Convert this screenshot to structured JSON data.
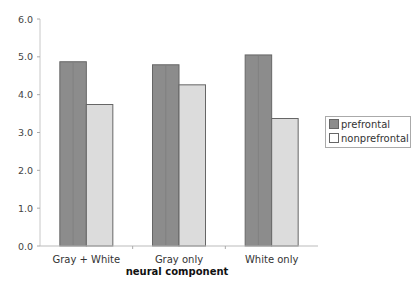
{
  "chart_data": {
    "type": "bar",
    "title": "",
    "xlabel": "neural component",
    "ylabel": "",
    "categories": [
      "Gray + White",
      "Gray only",
      "White only"
    ],
    "series": [
      {
        "name": "prefrontal",
        "values": [
          4.87,
          4.79,
          5.05
        ],
        "color": "#8c8c8c"
      },
      {
        "name": "nonprefrontal",
        "values": [
          3.74,
          4.26,
          3.37
        ],
        "color": "#dcdcdc"
      }
    ],
    "ylim": [
      0,
      6
    ],
    "yticks": [
      "0.0",
      "1.0",
      "2.0",
      "3.0",
      "4.0",
      "5.0",
      "6.0"
    ],
    "grid": false,
    "legend_position": "right"
  },
  "legend": {
    "items": [
      {
        "label": "prefrontal",
        "color": "#8c8c8c"
      },
      {
        "label": "nonprefrontal",
        "color": "#ffffff"
      }
    ]
  }
}
